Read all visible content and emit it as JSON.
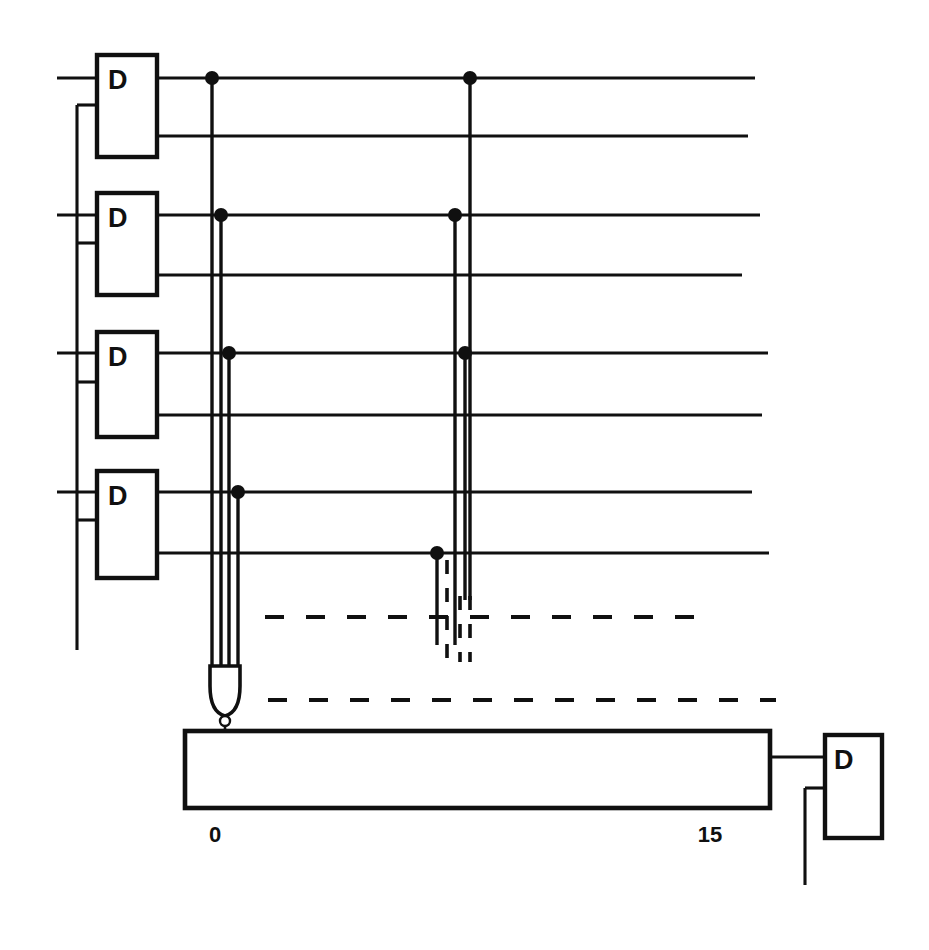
{
  "diagram": {
    "background_color": "#ffffff",
    "ink_color": "#101010",
    "width": 929,
    "height": 950
  },
  "flip_flops": {
    "label": "D",
    "count": 5,
    "items": [
      {
        "id": "ff-1",
        "label": "D",
        "x": 97,
        "y": 55,
        "w": 60,
        "h": 102,
        "d_in_y": 78,
        "clk_y": 105,
        "q_y": 78,
        "qbar_y": 136
      },
      {
        "id": "ff-2",
        "label": "D",
        "x": 97,
        "y": 193,
        "w": 60,
        "h": 102,
        "d_in_y": 215,
        "clk_y": 243,
        "q_y": 215,
        "qbar_y": 275
      },
      {
        "id": "ff-3",
        "label": "D",
        "x": 97,
        "y": 332,
        "w": 60,
        "h": 105,
        "d_in_y": 353,
        "clk_y": 382,
        "q_y": 353,
        "qbar_y": 415
      },
      {
        "id": "ff-4",
        "label": "D",
        "x": 97,
        "y": 471,
        "w": 60,
        "h": 107,
        "d_in_y": 492,
        "clk_y": 520,
        "q_y": 492,
        "qbar_y": 553
      },
      {
        "id": "ff-out",
        "label": "D",
        "x": 825,
        "y": 735,
        "w": 57,
        "h": 103,
        "d_in_y": 757,
        "clk_y": 788,
        "q_y": 757,
        "qbar_y": 0
      }
    ]
  },
  "output_lines": {
    "description": "Eight horizontal Q / Q-bar output rails running to the right edge",
    "rows": [
      {
        "name": "q1",
        "y": 78,
        "x_start": 157,
        "x_end": 755
      },
      {
        "name": "qbar1",
        "y": 136,
        "x_start": 157,
        "x_end": 748
      },
      {
        "name": "q2",
        "y": 215,
        "x_start": 157,
        "x_end": 760
      },
      {
        "name": "qbar2",
        "y": 275,
        "x_start": 157,
        "x_end": 742
      },
      {
        "name": "q3",
        "y": 353,
        "x_start": 157,
        "x_end": 768
      },
      {
        "name": "qbar3",
        "y": 415,
        "x_start": 157,
        "x_end": 762
      },
      {
        "name": "q4",
        "y": 492,
        "x_start": 157,
        "x_end": 752
      },
      {
        "name": "qbar4",
        "y": 553,
        "x_start": 157,
        "x_end": 769
      }
    ]
  },
  "input_lines": {
    "description": "D data inputs entering from the left edge",
    "x_start": 57,
    "rows": [
      78,
      215,
      353,
      492
    ]
  },
  "clock": {
    "description": "Common clock rail tapping every flip-flop clock input",
    "x": 77,
    "y_top": 105,
    "y_bottom": 650,
    "stub_x_end": 97,
    "stub_rows": [
      105,
      243,
      382,
      520
    ]
  },
  "bus_group_left": {
    "description": "First decoder address bus - four solid vertical lines tapped from Q outputs",
    "lines": [
      {
        "x": 212,
        "y_from": 78,
        "y_to": 676
      },
      {
        "x": 221,
        "y_from": 215,
        "y_to": 676
      },
      {
        "x": 229,
        "y_from": 353,
        "y_to": 676
      },
      {
        "x": 238,
        "y_from": 492,
        "y_to": 676
      }
    ],
    "junctions": [
      {
        "x": 212,
        "y": 78
      },
      {
        "x": 221,
        "y": 215
      },
      {
        "x": 229,
        "y": 353
      },
      {
        "x": 238,
        "y": 492
      }
    ]
  },
  "bus_group_right": {
    "description": "Second decoder address bus - partly drawn solid, continuing dashed below",
    "lines_solid": [
      {
        "x": 470,
        "y_from": 78,
        "y_to": 600
      },
      {
        "x": 455,
        "y_from": 215,
        "y_to": 645
      },
      {
        "x": 465,
        "y_from": 353,
        "y_to": 600
      },
      {
        "x": 437,
        "y_from": 553,
        "y_to": 645
      }
    ],
    "lines_dashed": [
      {
        "x": 470,
        "y_from": 596,
        "y_to": 660
      },
      {
        "x": 447,
        "y_from": 560,
        "y_to": 660
      },
      {
        "x": 460,
        "y_from": 596,
        "y_to": 660
      }
    ],
    "junctions": [
      {
        "x": 470,
        "y": 78
      },
      {
        "x": 455,
        "y": 215
      },
      {
        "x": 465,
        "y": 353
      },
      {
        "x": 437,
        "y": 553
      }
    ]
  },
  "ellipsis": {
    "description": "Dashed continuation lines indicating repeated structure",
    "horizontal": [
      {
        "name": "upper-ellipsis",
        "y": 617,
        "x_start": 265,
        "x_end": 697
      },
      {
        "name": "lower-ellipsis",
        "y": 700,
        "x_start": 268,
        "x_end": 776
      }
    ]
  },
  "and_gate": {
    "description": "Vertically oriented AND gate with inverting bubble feeding decoder input 0",
    "x_center": 225,
    "top_y": 666,
    "body_bottom_y": 712,
    "bubble": {
      "cx": 216,
      "cy": 718,
      "r": 5
    },
    "width": 48
  },
  "decoder": {
    "name": "one-of-sixteen-decoder",
    "x": 185,
    "y": 731,
    "w": 585,
    "h": 77,
    "label_left": "0",
    "label_right": "15",
    "label_left_x": 215,
    "label_right_x": 710,
    "label_y": 835
  },
  "output_stage": {
    "description": "Decoder output 15 routed to the final D flip-flop",
    "wire_from_x": 770,
    "wire_to_x": 825,
    "wire_y": 757,
    "clk_stub_x": 805,
    "clk_stub_y": 788,
    "clk_drop_y": 885
  },
  "legend": {
    "decoder_min": "0",
    "decoder_max": "15",
    "ff_letter": "D"
  }
}
